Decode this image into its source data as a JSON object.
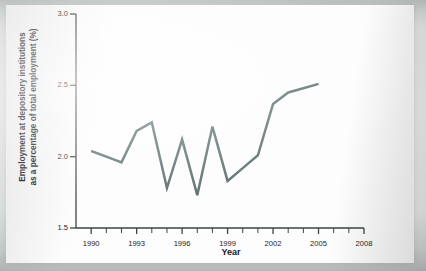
{
  "figure": {
    "caption_label": "Year",
    "ylabel_line1": "Employment at depository institutions",
    "ylabel_line2": "as a percentage of total employment (%)",
    "line_color": "#5d7070",
    "axis_color": "#3a4443",
    "plot_background": "#fdfdfd"
  },
  "chart_data": {
    "type": "line",
    "title": "",
    "subtitle": "",
    "xlabel": "Year",
    "ylabel": "Employment at depository institutions as a percentage of total employment (%)",
    "xlim": [
      1989,
      2008
    ],
    "ylim": [
      1.5,
      3.0
    ],
    "yticks": [
      1.5,
      2.0,
      2.5,
      3.0
    ],
    "ytick_labels": [
      "1.5",
      "2.0",
      "2.5",
      "3.0"
    ],
    "xticks": [
      1990,
      1993,
      1996,
      1999,
      2002,
      2005,
      2008
    ],
    "xtick_labels": [
      "1990",
      "1993",
      "1996",
      "1999",
      "2002",
      "2005",
      "2008"
    ],
    "x_minor_tick_interval": 1,
    "grid": false,
    "legend": null,
    "legend_position": "none",
    "series": [
      {
        "name": "Employment at depository institutions",
        "x": [
          1990,
          1991,
          1992,
          1993,
          1994,
          1995,
          1996,
          1997,
          1998,
          1999,
          2000,
          2001,
          2002,
          2003,
          2004,
          2005
        ],
        "values": [
          2.04,
          2.0,
          1.96,
          2.18,
          2.24,
          1.78,
          2.12,
          1.73,
          2.21,
          1.83,
          1.92,
          2.01,
          2.37,
          2.45,
          2.48,
          2.51
        ]
      }
    ]
  }
}
